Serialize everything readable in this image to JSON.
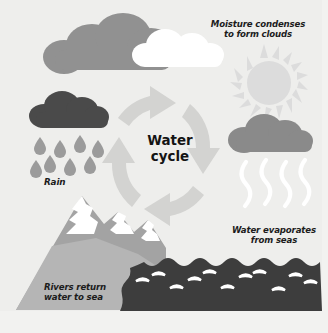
{
  "diagram": {
    "title_line1": "Water",
    "title_line2": "cycle",
    "center_title": "Water\ncycle",
    "background_color": "#f2f2f0",
    "labels": {
      "condense": "Moisture condenses\nto form clouds",
      "rain": "Rain",
      "evaporate": "Water evaporates\nfrom seas",
      "rivers": "Rivers return\nwater to sea"
    },
    "colors": {
      "background": "#f2f2f0",
      "cloud_gray": "#8e8e8e",
      "cloud_white": "#ffffff",
      "rain_cloud_dark": "#4a4a4a",
      "raindrop": "#9a9a9a",
      "sun": "#dcdcdc",
      "evap_cloud": "#8a8a8a",
      "vapor": "#ffffff",
      "mountain": "#a6a6a6",
      "mountain_front": "#b8b8b8",
      "snow": "#ffffff",
      "sea": "#3d3d3d",
      "arrow": "#d2d2d0",
      "text": "#1c1c1c"
    },
    "elements": [
      {
        "name": "top-cloud-gray",
        "type": "cloud"
      },
      {
        "name": "top-cloud-white",
        "type": "cloud"
      },
      {
        "name": "sun",
        "type": "sun",
        "rays": 16
      },
      {
        "name": "rain-cloud",
        "type": "cloud"
      },
      {
        "name": "raindrops",
        "type": "drops",
        "count": 8
      },
      {
        "name": "evaporation-cloud",
        "type": "cloud"
      },
      {
        "name": "vapor-lines",
        "type": "wavy-lines",
        "count": 4
      },
      {
        "name": "cycle-arrows",
        "type": "circular-arrows",
        "count": 4,
        "direction": "clockwise"
      },
      {
        "name": "mountain",
        "type": "mountain"
      },
      {
        "name": "sea",
        "type": "sea",
        "wave_marks": 11
      }
    ]
  }
}
